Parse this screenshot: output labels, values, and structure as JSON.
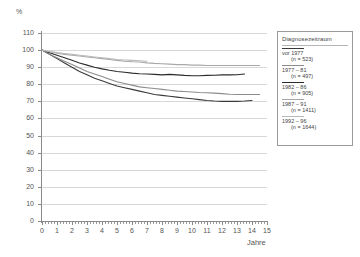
{
  "chart_data": {
    "type": "line",
    "title": "",
    "xlabel": "Jahre",
    "ylabel": "%",
    "xlim": [
      0,
      15
    ],
    "ylim": [
      0,
      110
    ],
    "y_ticks": [
      0,
      10,
      20,
      30,
      40,
      50,
      60,
      70,
      80,
      90,
      100,
      110
    ],
    "x_ticks": [
      0,
      1,
      2,
      3,
      4,
      5,
      6,
      7,
      8,
      9,
      10,
      11,
      12,
      13,
      14,
      15
    ],
    "grid": true,
    "legend_position": "right",
    "legend_title": "Diagnosezeitraum",
    "series": [
      {
        "name": "vor 1977",
        "label_line1": "vor 1977",
        "label_line2": "(n = 523)",
        "n": 523,
        "color": "#3a3a3a",
        "x": [
          0,
          0.5,
          1,
          1.5,
          2,
          2.5,
          3,
          3.5,
          4,
          4.5,
          5,
          5.5,
          6,
          6.5,
          7,
          7.5,
          8,
          8.5,
          9,
          9.5,
          10,
          10.5,
          11,
          11.5,
          12,
          12.5,
          13,
          13.5,
          14
        ],
        "values": [
          100,
          97.5,
          95,
          92.5,
          90,
          87.5,
          85.5,
          83.5,
          82,
          80.5,
          79,
          78,
          77,
          76,
          75,
          74,
          73.5,
          73,
          72.5,
          72,
          71.5,
          71,
          70.5,
          70.2,
          70,
          70,
          70,
          70.2,
          70.5
        ]
      },
      {
        "name": "1977 - 81",
        "label_line1": "1977 – 81",
        "label_line2": "(n = 497)",
        "n": 497,
        "color": "#8c8c8c",
        "x": [
          0,
          0.5,
          1,
          1.5,
          2,
          2.5,
          3,
          3.5,
          4,
          4.5,
          5,
          5.5,
          6,
          6.5,
          7,
          7.5,
          8,
          8.5,
          9,
          9.5,
          10,
          10.5,
          11,
          11.5,
          12,
          12.5,
          13,
          13.5,
          14,
          14.5
        ],
        "values": [
          100,
          97.5,
          95.5,
          93.5,
          91.5,
          89.5,
          87.5,
          86,
          84.5,
          83,
          81.5,
          80.5,
          79.5,
          78.5,
          78,
          77.5,
          77,
          76.5,
          76,
          75.8,
          75.5,
          75.2,
          75,
          74.8,
          74.5,
          74.2,
          74,
          74,
          74,
          74
        ]
      },
      {
        "name": "1982 - 86",
        "label_line1": "1982 – 86",
        "label_line2": "(n = 905)",
        "n": 905,
        "color": "#2b2b2b",
        "x": [
          0,
          0.5,
          1,
          1.5,
          2,
          2.5,
          3,
          3.5,
          4,
          4.5,
          5,
          5.5,
          6,
          6.5,
          7,
          7.5,
          8,
          8.5,
          9,
          9.5,
          10,
          10.5,
          11,
          11.5,
          12,
          12.5,
          13,
          13.5
        ],
        "values": [
          100,
          98.5,
          97,
          95.5,
          94,
          92.5,
          91.2,
          90,
          89,
          88.2,
          87.5,
          87,
          86.5,
          86.2,
          86,
          85.8,
          85.5,
          85.8,
          85.5,
          85.2,
          85,
          85,
          85.2,
          85.3,
          85.5,
          85.5,
          85.6,
          86
        ]
      },
      {
        "name": "1987 - 91",
        "label_line1": "1987 – 91",
        "label_line2": "(n = 1411)",
        "n": 1411,
        "color": "#a8a8a8",
        "x": [
          0,
          0.5,
          1,
          1.5,
          2,
          2.5,
          3,
          3.5,
          4,
          4.5,
          5,
          5.5,
          6,
          6.5,
          7,
          7.5,
          8,
          8.5,
          9,
          9.5,
          10,
          10.5,
          11,
          11.5,
          12,
          12.5,
          13,
          13.5,
          14,
          14.5
        ],
        "values": [
          100,
          99,
          98.2,
          97.5,
          97,
          96.5,
          96,
          95.5,
          95,
          94.5,
          94,
          93.5,
          93.2,
          93,
          92.5,
          92.2,
          92,
          91.8,
          91.5,
          91.5,
          91.2,
          91.2,
          91,
          91,
          91,
          91,
          91,
          91,
          91,
          91
        ]
      },
      {
        "name": "1992 - 96",
        "label_line1": "1992 – 96",
        "label_line2": "(n = 1644)",
        "n": 1644,
        "color": "#b9b9b9",
        "x": [
          0,
          0.5,
          1,
          1.5,
          2,
          2.5,
          3,
          3.5,
          4,
          4.5,
          5,
          5.5,
          6,
          6.5,
          7
        ],
        "values": [
          100,
          99.2,
          98.5,
          98,
          97.5,
          97,
          96.5,
          96,
          95.5,
          95,
          94.5,
          94.2,
          94,
          93.8,
          93.5
        ]
      }
    ]
  }
}
